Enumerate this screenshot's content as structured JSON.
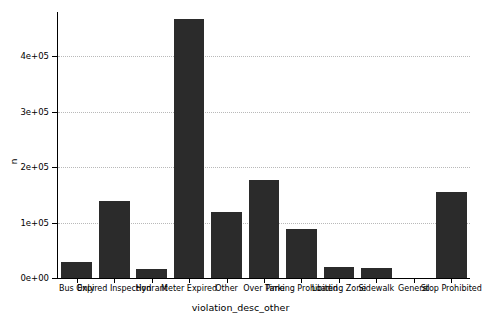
{
  "chart_data": {
    "type": "bar",
    "title": "",
    "xlabel": "violation_desc_other",
    "ylabel": "n",
    "categories": [
      "Bus Only",
      "Expired Inspection",
      "Hydrant",
      "Meter Expired",
      "Other",
      "Over Time",
      "Parking Prohibited",
      "Loading Zone",
      "Sidewalk",
      "General",
      "Stop Prohibited"
    ],
    "values": [
      28000,
      139000,
      17000,
      467000,
      120000,
      177000,
      89000,
      20000,
      18000,
      0,
      155000
    ],
    "ylim": [
      0,
      480000
    ],
    "ytick_values": [
      0,
      100000,
      200000,
      300000,
      400000
    ],
    "ytick_labels": [
      "0e+00",
      "1e+05",
      "2e+05",
      "3e+05",
      "4e+05"
    ],
    "grid": true,
    "legend": "none",
    "bar_color": "#2b2b2b",
    "grid_color": "#b9b9b9",
    "background": "#ffffff"
  }
}
